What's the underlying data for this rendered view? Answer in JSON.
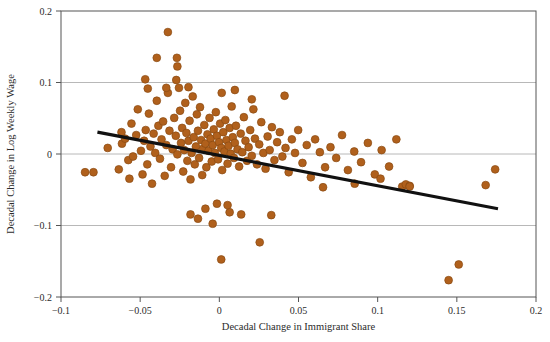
{
  "chart_data": {
    "type": "scatter",
    "title": "",
    "xlabel": "Decadal Change in Immigrant Share",
    "ylabel": "Decadal Change in Log Weekly Wage",
    "xlim": [
      -0.1,
      0.2
    ],
    "ylim": [
      -0.2,
      0.2
    ],
    "xticks": [
      -0.1,
      -0.05,
      0,
      0.05,
      0.1,
      0.15,
      0.2
    ],
    "xtick_labels": [
      "−0.1",
      "−0.05",
      "0",
      "0.05",
      "0.1",
      "0.15",
      "0.2"
    ],
    "yticks": [
      -0.2,
      -0.1,
      0,
      0.1,
      0.2
    ],
    "ytick_labels": [
      "−0.2",
      "−0.1",
      "0",
      "0.1",
      "0.2"
    ],
    "grid": "horizontal",
    "grid_color": "#b0b0b0",
    "frame_color": "#555555",
    "background": "#ffffff",
    "marker_color": "#b0601c",
    "marker_edge_color": "#8a4a12",
    "marker_size": 5.4,
    "legend": [],
    "annotations": [],
    "fit_line": {
      "name": "linear fit",
      "color": "#111111",
      "width": 3.2,
      "x_start": -0.077,
      "y_start": 0.0305,
      "x_end": 0.176,
      "y_end": -0.0765,
      "slope": -0.423,
      "intercept": -0.0021
    },
    "series": [
      {
        "name": "metro areas",
        "points": [
          [
            -0.0795,
            -0.0255
          ],
          [
            -0.0705,
            0.0085
          ],
          [
            -0.0635,
            -0.0215
          ],
          [
            -0.0615,
            0.0145
          ],
          [
            -0.0595,
            0.0215
          ],
          [
            -0.0575,
            -0.0085
          ],
          [
            -0.0555,
            0.0425
          ],
          [
            -0.0545,
            -0.0035
          ],
          [
            -0.0525,
            0.0265
          ],
          [
            -0.0515,
            0.0625
          ],
          [
            -0.0495,
            0.0045
          ],
          [
            -0.0485,
            -0.0285
          ],
          [
            -0.0475,
            0.0185
          ],
          [
            -0.0465,
            0.0335
          ],
          [
            -0.0455,
            -0.0145
          ],
          [
            -0.0445,
            0.0565
          ],
          [
            -0.0435,
            0.0105
          ],
          [
            -0.0425,
            -0.0415
          ],
          [
            -0.0415,
            0.0285
          ],
          [
            -0.0405,
            0.0015
          ],
          [
            -0.0395,
            0.0745
          ],
          [
            -0.0385,
            0.0395
          ],
          [
            -0.0375,
            -0.0065
          ],
          [
            -0.0365,
            0.0205
          ],
          [
            -0.0355,
            0.0455
          ],
          [
            -0.0345,
            -0.0305
          ],
          [
            -0.0335,
            0.0125
          ],
          [
            -0.0325,
            0.0855
          ],
          [
            -0.0315,
            0.0325
          ],
          [
            -0.0305,
            -0.0185
          ],
          [
            -0.0295,
            0.0065
          ],
          [
            -0.0285,
            0.0505
          ],
          [
            -0.0275,
            0.0255
          ],
          [
            -0.0265,
            -0.0005
          ],
          [
            -0.0255,
            0.0925
          ],
          [
            -0.0248,
            0.0605
          ],
          [
            -0.0242,
            0.0155
          ],
          [
            -0.0235,
            0.0365
          ],
          [
            -0.0228,
            -0.0245
          ],
          [
            -0.0222,
            0.0055
          ],
          [
            -0.0215,
            0.0715
          ],
          [
            -0.0208,
            0.0295
          ],
          [
            -0.0202,
            -0.0095
          ],
          [
            -0.0195,
            0.0185
          ],
          [
            -0.0188,
            0.0465
          ],
          [
            -0.0182,
            -0.0355
          ],
          [
            -0.0175,
            0.0015
          ],
          [
            -0.0168,
            0.0805
          ],
          [
            -0.0162,
            0.0235
          ],
          [
            -0.0155,
            -0.0145
          ],
          [
            -0.0148,
            0.0105
          ],
          [
            -0.0142,
            0.0555
          ],
          [
            -0.0135,
            0.0325
          ],
          [
            -0.0128,
            -0.0055
          ],
          [
            -0.0122,
            0.0655
          ],
          [
            -0.0115,
            0.0195
          ],
          [
            -0.0108,
            -0.0295
          ],
          [
            -0.0102,
            0.0075
          ],
          [
            -0.0095,
            0.0405
          ],
          [
            -0.0088,
            0.0145
          ],
          [
            -0.0082,
            -0.0185
          ],
          [
            -0.0075,
            0.0275
          ],
          [
            -0.0068,
            0.0045
          ],
          [
            -0.0062,
            0.0505
          ],
          [
            -0.0055,
            0.0215
          ],
          [
            -0.0048,
            -0.0105
          ],
          [
            -0.0042,
            0.0125
          ],
          [
            -0.0035,
            0.0345
          ],
          [
            -0.0028,
            0.0015
          ],
          [
            -0.0022,
            0.0585
          ],
          [
            -0.0015,
            0.0255
          ],
          [
            -0.0008,
            -0.0075
          ],
          [
            -0.0002,
            0.0165
          ],
          [
            0.0005,
            0.0425
          ],
          [
            0.0012,
            0.0085
          ],
          [
            0.0018,
            -0.0225
          ],
          [
            0.0025,
            0.0305
          ],
          [
            0.0032,
            0.0035
          ],
          [
            0.0038,
            0.0475
          ],
          [
            0.0045,
            0.0195
          ],
          [
            0.0052,
            -0.0135
          ],
          [
            0.0058,
            0.0115
          ],
          [
            0.0065,
            0.0365
          ],
          [
            0.0072,
            0.0005
          ],
          [
            0.0078,
            0.0665
          ],
          [
            0.0085,
            0.0235
          ],
          [
            0.0092,
            -0.0055
          ],
          [
            0.0098,
            0.0155
          ],
          [
            0.0105,
            0.0395
          ],
          [
            0.0115,
            0.0065
          ],
          [
            0.0125,
            -0.0175
          ],
          [
            0.0135,
            0.0285
          ],
          [
            0.0145,
            0.0025
          ],
          [
            0.0155,
            0.0515
          ],
          [
            0.0165,
            0.0185
          ],
          [
            0.0175,
            -0.0095
          ],
          [
            0.0185,
            0.0095
          ],
          [
            0.0195,
            0.0335
          ],
          [
            0.0205,
            -0.0025
          ],
          [
            0.0215,
            0.0625
          ],
          [
            0.0225,
            0.0215
          ],
          [
            0.0238,
            -0.0145
          ],
          [
            0.0252,
            0.0135
          ],
          [
            0.0265,
            0.0445
          ],
          [
            0.0278,
            0.0015
          ],
          [
            0.0292,
            -0.0205
          ],
          [
            0.0305,
            0.0245
          ],
          [
            0.0318,
            0.0055
          ],
          [
            0.0332,
            0.0375
          ],
          [
            0.0348,
            -0.0085
          ],
          [
            0.0365,
            0.0165
          ],
          [
            0.0382,
            0.0305
          ],
          [
            0.0398,
            -0.0035
          ],
          [
            0.0418,
            0.0085
          ],
          [
            0.0438,
            -0.0255
          ],
          [
            0.0458,
            0.0205
          ],
          [
            0.0478,
            0.0015
          ],
          [
            0.0498,
            0.0335
          ],
          [
            0.0525,
            -0.0125
          ],
          [
            0.0552,
            0.0125
          ],
          [
            0.0578,
            -0.0325
          ],
          [
            0.0605,
            0.0205
          ],
          [
            0.0635,
            0.0025
          ],
          [
            0.0668,
            -0.0185
          ],
          [
            0.0702,
            0.0095
          ],
          [
            0.0738,
            -0.0055
          ],
          [
            0.0775,
            0.0265
          ],
          [
            0.0812,
            -0.0225
          ],
          [
            0.0852,
            0.0035
          ],
          [
            0.0895,
            -0.0115
          ],
          [
            0.0938,
            0.0155
          ],
          [
            0.0982,
            -0.0285
          ],
          [
            0.1025,
            0.0055
          ],
          [
            0.1072,
            -0.0175
          ],
          [
            0.1118,
            0.0205
          ],
          [
            0.1155,
            -0.0455
          ],
          [
            0.1178,
            -0.0425
          ],
          [
            0.1202,
            -0.0445
          ],
          [
            0.1448,
            -0.1765
          ],
          [
            0.1512,
            -0.1545
          ],
          [
            0.1682,
            -0.0435
          ],
          [
            0.1742,
            -0.0215
          ],
          [
            -0.0325,
            0.1705
          ],
          [
            -0.0268,
            0.1345
          ],
          [
            -0.0265,
            0.1225
          ],
          [
            -0.0395,
            0.1345
          ],
          [
            -0.0272,
            0.1035
          ],
          [
            -0.0468,
            0.1045
          ],
          [
            -0.0452,
            0.0915
          ],
          [
            -0.0335,
            0.0925
          ],
          [
            -0.0195,
            0.0935
          ],
          [
            0.0015,
            0.0855
          ],
          [
            0.0205,
            0.0765
          ],
          [
            0.0098,
            0.0895
          ],
          [
            0.0412,
            0.0815
          ],
          [
            -0.0618,
            0.0305
          ],
          [
            -0.0568,
            -0.0345
          ],
          [
            -0.0848,
            -0.0255
          ],
          [
            0.0012,
            -0.1475
          ],
          [
            0.0255,
            -0.1235
          ],
          [
            -0.0042,
            -0.0975
          ],
          [
            -0.0135,
            -0.0905
          ],
          [
            -0.0182,
            -0.0845
          ],
          [
            -0.0088,
            -0.0765
          ],
          [
            0.0065,
            -0.0815
          ],
          [
            0.0138,
            -0.0845
          ],
          [
            0.0328,
            -0.0855
          ],
          [
            0.0052,
            -0.0715
          ],
          [
            -0.0015,
            -0.0695
          ],
          [
            0.1202,
            -0.0455
          ],
          [
            0.1018,
            -0.0345
          ],
          [
            0.0855,
            -0.0415
          ],
          [
            0.0655,
            -0.0465
          ]
        ]
      }
    ]
  }
}
